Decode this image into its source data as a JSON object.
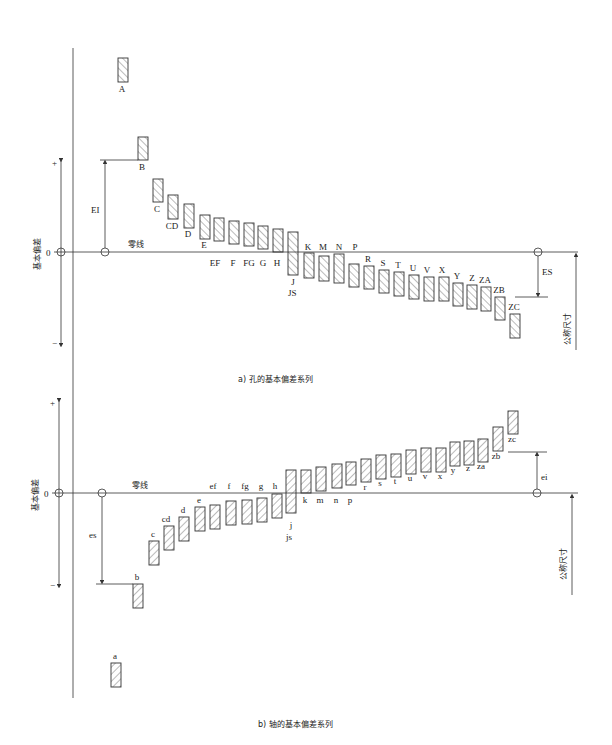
{
  "colors": {
    "line": "#333333",
    "hatch": "#555555",
    "background": "#ffffff"
  },
  "hole": {
    "caption": "a) 孔的基本偏差系列",
    "zero_line_label": "零线",
    "axis_label": "基本偏差",
    "zero_tick": "0",
    "plus": "+",
    "minus": "−",
    "EI_label": "EI",
    "ES_label": "ES",
    "nominal_size_label": "公称尺寸",
    "zero_y": 252,
    "bars": [
      {
        "label": "A",
        "x": 118,
        "y1": 58,
        "y2": 82,
        "lx": 122,
        "ly": 92
      },
      {
        "label": "B",
        "x": 138,
        "y1": 137,
        "y2": 160,
        "lx": 142,
        "ly": 170
      },
      {
        "label": "C",
        "x": 153,
        "y1": 179,
        "y2": 202,
        "lx": 157,
        "ly": 212
      },
      {
        "label": "CD",
        "x": 168,
        "y1": 195,
        "y2": 219,
        "lx": 172,
        "ly": 229
      },
      {
        "label": "D",
        "x": 184,
        "y1": 204,
        "y2": 228,
        "lx": 188,
        "ly": 237
      },
      {
        "label": "E",
        "x": 200,
        "y1": 215,
        "y2": 239,
        "lx": 204,
        "ly": 248
      },
      {
        "label": "EF",
        "x": 214,
        "y1": 218,
        "y2": 241,
        "lx": 215,
        "ly": 266
      },
      {
        "label": "F",
        "x": 229,
        "y1": 221,
        "y2": 244,
        "lx": 233,
        "ly": 266
      },
      {
        "label": "FG",
        "x": 244,
        "y1": 223,
        "y2": 246,
        "lx": 249,
        "ly": 266
      },
      {
        "label": "G",
        "x": 258,
        "y1": 226,
        "y2": 249,
        "lx": 263,
        "ly": 266
      },
      {
        "label": "H",
        "x": 273,
        "y1": 229,
        "y2": 252,
        "lx": 277,
        "ly": 266
      },
      {
        "label": "J",
        "x": 288,
        "y1": 232,
        "y2": 275,
        "lx": 293,
        "ly": 285
      },
      {
        "label": "K",
        "x": 304,
        "y1": 253,
        "y2": 278,
        "lx": 308,
        "ly": 250
      },
      {
        "label": "M",
        "x": 319,
        "y1": 256,
        "y2": 281,
        "lx": 323,
        "ly": 250
      },
      {
        "label": "N",
        "x": 334,
        "y1": 254,
        "y2": 283,
        "lx": 339,
        "ly": 250
      },
      {
        "label": "P",
        "x": 349,
        "y1": 264,
        "y2": 287,
        "lx": 355,
        "ly": 250
      },
      {
        "label": "R",
        "x": 364,
        "y1": 266,
        "y2": 289,
        "lx": 368,
        "ly": 262
      },
      {
        "label": "S",
        "x": 379,
        "y1": 270,
        "y2": 293,
        "lx": 383,
        "ly": 266
      },
      {
        "label": "T",
        "x": 394,
        "y1": 272,
        "y2": 296,
        "lx": 398,
        "ly": 268
      },
      {
        "label": "U",
        "x": 409,
        "y1": 275,
        "y2": 299,
        "lx": 413,
        "ly": 271
      },
      {
        "label": "V",
        "x": 424,
        "y1": 277,
        "y2": 301,
        "lx": 427,
        "ly": 273
      },
      {
        "label": "X",
        "x": 439,
        "y1": 277,
        "y2": 301,
        "lx": 442,
        "ly": 273
      },
      {
        "label": "Y",
        "x": 453,
        "y1": 283,
        "y2": 306,
        "lx": 457,
        "ly": 279
      },
      {
        "label": "Z",
        "x": 467,
        "y1": 285,
        "y2": 309,
        "lx": 472,
        "ly": 281
      },
      {
        "label": "ZA",
        "x": 481,
        "y1": 287,
        "y2": 311,
        "lx": 485,
        "ly": 283
      },
      {
        "label": "ZB",
        "x": 495,
        "y1": 297,
        "y2": 320,
        "lx": 499,
        "ly": 293
      },
      {
        "label": "ZC",
        "x": 510,
        "y1": 314,
        "y2": 338,
        "lx": 514,
        "ly": 310
      }
    ],
    "JS_label": "JS"
  },
  "shaft": {
    "caption": "b) 轴的基本偏差系列",
    "zero_line_label": "零线",
    "axis_label": "基本偏差",
    "zero_tick": "0",
    "plus": "+",
    "minus": "−",
    "es_label": "es",
    "ei_label": "ei",
    "nominal_size_label": "公称尺寸",
    "zero_y": 493,
    "bars": [
      {
        "label": "a",
        "x": 111,
        "y1": 663,
        "y2": 687,
        "lx": 115,
        "ly": 659
      },
      {
        "label": "b",
        "x": 133,
        "y1": 584,
        "y2": 608,
        "lx": 137,
        "ly": 580
      },
      {
        "label": "c",
        "x": 149,
        "y1": 541,
        "y2": 565,
        "lx": 153,
        "ly": 537
      },
      {
        "label": "cd",
        "x": 164,
        "y1": 526,
        "y2": 550,
        "lx": 166,
        "ly": 522
      },
      {
        "label": "d",
        "x": 179,
        "y1": 517,
        "y2": 541,
        "lx": 183,
        "ly": 513
      },
      {
        "label": "e",
        "x": 195,
        "y1": 507,
        "y2": 531,
        "lx": 199,
        "ly": 503
      },
      {
        "label": "ef",
        "x": 210,
        "y1": 505,
        "y2": 529,
        "lx": 213,
        "ly": 489
      },
      {
        "label": "f",
        "x": 226,
        "y1": 501,
        "y2": 525,
        "lx": 229,
        "ly": 489
      },
      {
        "label": "fg",
        "x": 242,
        "y1": 500,
        "y2": 524,
        "lx": 245,
        "ly": 489
      },
      {
        "label": "g",
        "x": 257,
        "y1": 498,
        "y2": 522,
        "lx": 261,
        "ly": 489
      },
      {
        "label": "h",
        "x": 272,
        "y1": 494,
        "y2": 518,
        "lx": 275,
        "ly": 489
      },
      {
        "label": "j",
        "x": 286,
        "y1": 470,
        "y2": 513,
        "lx": 291,
        "ly": 528
      },
      {
        "label": "k",
        "x": 301,
        "y1": 470,
        "y2": 493,
        "lx": 305,
        "ly": 503
      },
      {
        "label": "m",
        "x": 316,
        "y1": 467,
        "y2": 491,
        "lx": 320,
        "ly": 503
      },
      {
        "label": "n",
        "x": 332,
        "y1": 464,
        "y2": 488,
        "lx": 336,
        "ly": 503
      },
      {
        "label": "p",
        "x": 346,
        "y1": 462,
        "y2": 485,
        "lx": 350,
        "ly": 503
      },
      {
        "label": "r",
        "x": 361,
        "y1": 459,
        "y2": 482,
        "lx": 365,
        "ly": 490
      },
      {
        "label": "s",
        "x": 376,
        "y1": 455,
        "y2": 479,
        "lx": 380,
        "ly": 486
      },
      {
        "label": "t",
        "x": 391,
        "y1": 454,
        "y2": 477,
        "lx": 395,
        "ly": 484
      },
      {
        "label": "u",
        "x": 406,
        "y1": 450,
        "y2": 474,
        "lx": 410,
        "ly": 481
      },
      {
        "label": "v",
        "x": 421,
        "y1": 448,
        "y2": 472,
        "lx": 425,
        "ly": 479
      },
      {
        "label": "x",
        "x": 436,
        "y1": 448,
        "y2": 472,
        "lx": 440,
        "ly": 479
      },
      {
        "label": "y",
        "x": 450,
        "y1": 442,
        "y2": 466,
        "lx": 453,
        "ly": 473
      },
      {
        "label": "z",
        "x": 464,
        "y1": 441,
        "y2": 465,
        "lx": 468,
        "ly": 471
      },
      {
        "label": "za",
        "x": 478,
        "y1": 439,
        "y2": 462,
        "lx": 481,
        "ly": 469
      },
      {
        "label": "zb",
        "x": 493,
        "y1": 427,
        "y2": 451,
        "lx": 496,
        "ly": 459
      },
      {
        "label": "zc",
        "x": 508,
        "y1": 411,
        "y2": 434,
        "lx": 512,
        "ly": 442
      }
    ],
    "js_label": "js"
  }
}
